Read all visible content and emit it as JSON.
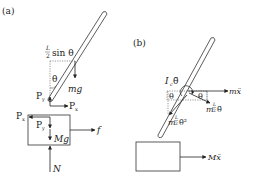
{
  "panel_a": {
    "label": "(a)",
    "rod_com_offset": "L/2 sin θ",
    "frac_num": "L",
    "frac_den": "2",
    "sin_theta": "sin θ",
    "angle": "θ",
    "weight_rod": "mg",
    "pin_force_y_rod": "P",
    "pin_force_y_sub": "y",
    "pin_force_x_rod": "P",
    "pin_force_x_sub": "x",
    "block_force_x": "P",
    "block_force_x_sub": "x",
    "block_force_y": "P",
    "block_force_y_sub": "y",
    "weight_block": "Mg",
    "friction": "f",
    "normal": "N"
  },
  "panel_b": {
    "label": "(b)",
    "inertia_term": "I",
    "inertia_sub": "c",
    "theta_ddot": "θ̈",
    "angle_left": "θ",
    "angle_right": "θ",
    "rod_inertial": "mẍ",
    "tangential": "m",
    "tangential_frac_num": "L",
    "tangential_frac_den": "2",
    "tangential_suffix": "θ̈",
    "centripetal": "m",
    "centripetal_frac_num": "L",
    "centripetal_frac_den": "2",
    "centripetal_suffix": "θ̇²",
    "block_inertial": "Mẍ"
  },
  "colors": {
    "line": "#333333",
    "dotted": "#555555",
    "background": "#ffffff"
  }
}
